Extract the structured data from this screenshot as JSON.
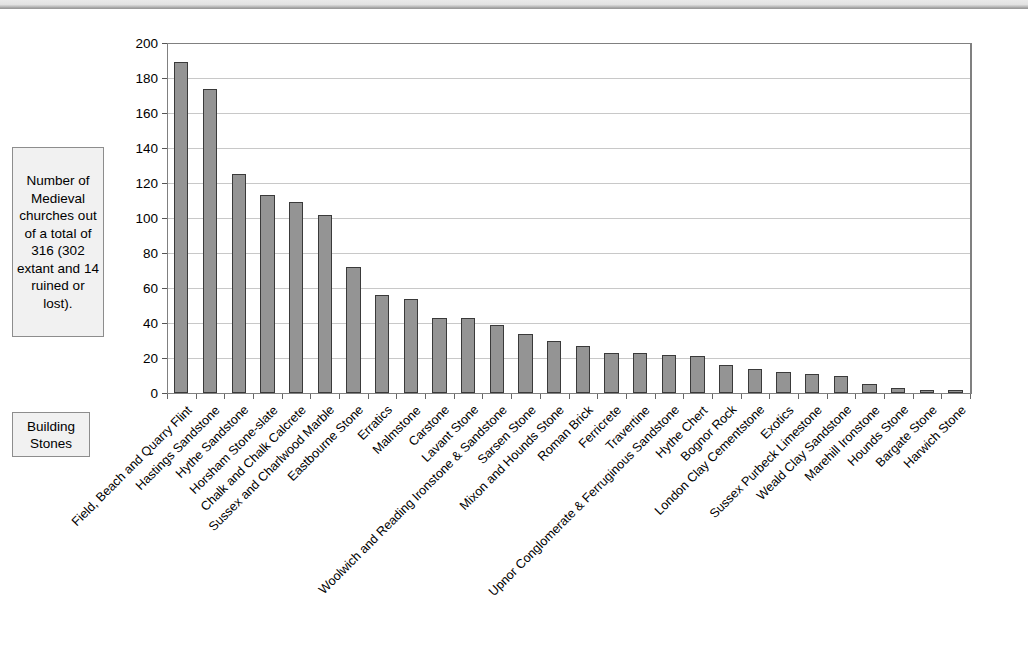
{
  "annotation": {
    "text": "Number of Medieval churches with each Type of building stone, as recorded in the Atlas survey."
  },
  "axis_caption": {
    "y_title": "Number of Medieval churches out of a total of 316 (302 extant and 14 ruined or lost).",
    "x_title": "Building Stones"
  },
  "chart_data": {
    "type": "bar",
    "title": "Number of Medieval churches with each Type of building stone, as recorded in the Atlas survey.",
    "xlabel": "Building Stones",
    "ylabel": "Number of Medieval churches out of a total of 316 (302 extant and 14 ruined or lost).",
    "ylim": [
      0,
      200
    ],
    "ytick_values": [
      0,
      20,
      40,
      60,
      80,
      100,
      120,
      140,
      160,
      180,
      200
    ],
    "grid": true,
    "legend": "none",
    "categories": [
      "Field, Beach and Quarry Flint",
      "Hastings Sandstone",
      "Hythe Sandstone",
      "Horsham Stone-slate",
      "Chalk and Chalk Calcrete",
      "Sussex and Charlwood Marble",
      "Eastbourne Stone",
      "Erratics",
      "Malmstone",
      "Carstone",
      "Lavant Stone",
      "Woolwich and Reading Ironstone & Sandstone",
      "Sarsen Stone",
      "Mixon and Hounds Stone",
      "Roman Brick",
      "Ferricrete",
      "Travertine",
      "Upnor Conglomerate & Ferruginous Sandstone",
      "Hythe Chert",
      "Bognor Rock",
      "London Clay Cementstone",
      "Exotics",
      "Sussex Purbeck Limestone",
      "Weald Clay Sandstone",
      "Marehill Ironstone",
      "Hounds Stone",
      "Bargate Stone",
      "Harwich Stone"
    ],
    "values": [
      189,
      174,
      125,
      113,
      109,
      102,
      72,
      56,
      54,
      43,
      43,
      39,
      34,
      30,
      27,
      23,
      23,
      22,
      21,
      16,
      14,
      12,
      11,
      10,
      5,
      3,
      1,
      1
    ]
  },
  "colors": {
    "bar_fill": "#949494",
    "bar_border": "#3a3a3a",
    "gridline": "#c8c8c8",
    "axis": "#808080",
    "box_fill": "#f1f1f1",
    "box_border": "#8d8d8d"
  }
}
